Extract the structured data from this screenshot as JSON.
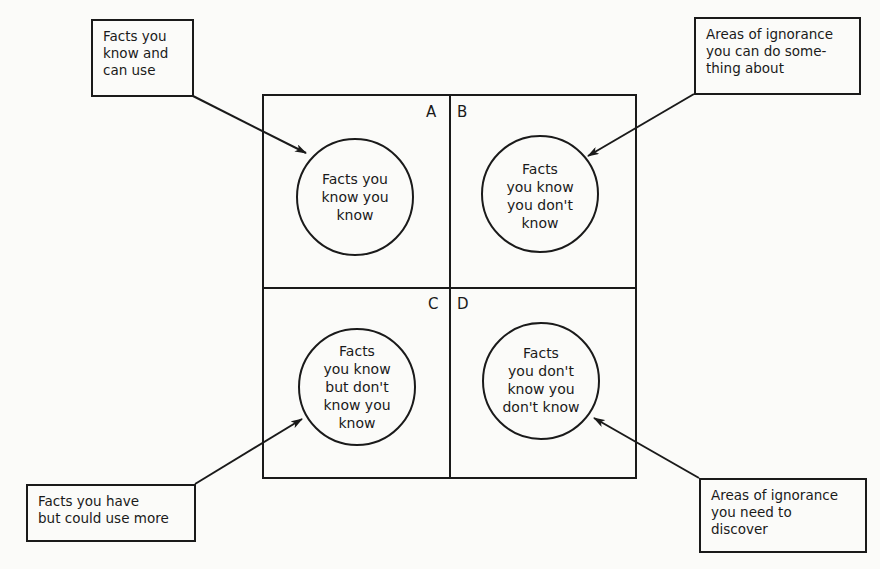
{
  "diagram": {
    "quadrants": [
      {
        "id": "A",
        "label": "A",
        "circle_text": "Facts you\nknow you\nknow"
      },
      {
        "id": "B",
        "label": "B",
        "circle_text": "Facts\nyou know\nyou don't\nknow"
      },
      {
        "id": "C",
        "label": "C",
        "circle_text": "Facts\nyou know\nbut don't\nknow you\nknow"
      },
      {
        "id": "D",
        "label": "D",
        "circle_text": "Facts\nyou don't\nknow you\ndon't know"
      }
    ],
    "callouts": {
      "top_left": "Facts you\nknow and\ncan use",
      "top_right": "Areas of ignorance\nyou can do some-\nthing about",
      "bottom_left": "Facts you have\nbut could use more",
      "bottom_right": "Areas of ignorance\nyou need to\ndiscover"
    },
    "colors": {
      "line": "#1a1a1a",
      "background": "#fbfbf9"
    }
  }
}
